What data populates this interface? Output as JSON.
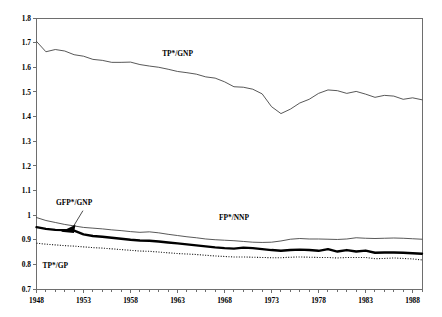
{
  "chart_data": {
    "type": "line",
    "title": "",
    "subtitle": "",
    "xlabel": "",
    "ylabel": "",
    "xlim": [
      1948,
      1989
    ],
    "ylim": [
      0.7,
      1.8
    ],
    "grid": false,
    "legend_position": "inline-annotations",
    "y_ticks": [
      "0.7",
      "0.8",
      "0.9",
      "1",
      "1.1",
      "1.2",
      "1.3",
      "1.4",
      "1.5",
      "1.6",
      "1.7",
      "1.8"
    ],
    "y_tick_values": [
      0.7,
      0.8,
      0.9,
      1.0,
      1.1,
      1.2,
      1.3,
      1.4,
      1.5,
      1.6,
      1.7,
      1.8
    ],
    "x_ticks": [
      "1948",
      "1953",
      "1958",
      "1963",
      "1968",
      "1973",
      "1978",
      "1983",
      "1988"
    ],
    "x_tick_values": [
      1948,
      1953,
      1958,
      1963,
      1968,
      1973,
      1978,
      1983,
      1988
    ],
    "x_minor_step": 1,
    "x": [
      1948,
      1949,
      1950,
      1951,
      1952,
      1953,
      1954,
      1955,
      1956,
      1957,
      1958,
      1959,
      1960,
      1961,
      1962,
      1963,
      1964,
      1965,
      1966,
      1967,
      1968,
      1969,
      1970,
      1971,
      1972,
      1973,
      1974,
      1975,
      1976,
      1977,
      1978,
      1979,
      1980,
      1981,
      1982,
      1983,
      1984,
      1985,
      1986,
      1987,
      1988,
      1989
    ],
    "series": [
      {
        "name": "TP*/GNP",
        "style": "thin-solid",
        "color": "#3a3a3a",
        "label_x": 1963,
        "label_y": 1.645,
        "values": [
          1.705,
          1.663,
          1.672,
          1.666,
          1.651,
          1.645,
          1.632,
          1.628,
          1.62,
          1.62,
          1.621,
          1.611,
          1.605,
          1.6,
          1.592,
          1.583,
          1.578,
          1.572,
          1.561,
          1.556,
          1.541,
          1.521,
          1.519,
          1.511,
          1.492,
          1.44,
          1.412,
          1.43,
          1.455,
          1.47,
          1.494,
          1.508,
          1.505,
          1.494,
          1.502,
          1.491,
          1.478,
          1.486,
          1.483,
          1.47,
          1.476,
          1.468
        ]
      },
      {
        "name": "FP*/NNP",
        "style": "thin-solid",
        "color": "#3a3a3a",
        "label_x": 1969,
        "label_y": 0.981,
        "values": [
          0.99,
          0.978,
          0.97,
          0.962,
          0.956,
          0.95,
          0.947,
          0.944,
          0.94,
          0.937,
          0.933,
          0.93,
          0.932,
          0.928,
          0.922,
          0.917,
          0.912,
          0.908,
          0.903,
          0.9,
          0.898,
          0.896,
          0.893,
          0.89,
          0.889,
          0.89,
          0.895,
          0.902,
          0.905,
          0.903,
          0.903,
          0.902,
          0.901,
          0.903,
          0.908,
          0.906,
          0.905,
          0.906,
          0.907,
          0.906,
          0.904,
          0.902
        ]
      },
      {
        "name": "GFP*/GNP",
        "style": "thick-solid",
        "color": "#000000",
        "label_x": 1952,
        "label_y": 1.041,
        "values": [
          0.951,
          0.944,
          0.94,
          0.939,
          0.937,
          0.922,
          0.915,
          0.912,
          0.908,
          0.904,
          0.9,
          0.897,
          0.896,
          0.893,
          0.889,
          0.885,
          0.881,
          0.877,
          0.873,
          0.869,
          0.866,
          0.864,
          0.868,
          0.866,
          0.862,
          0.858,
          0.855,
          0.858,
          0.86,
          0.858,
          0.855,
          0.862,
          0.852,
          0.858,
          0.852,
          0.856,
          0.847,
          0.848,
          0.848,
          0.847,
          0.845,
          0.843
        ]
      },
      {
        "name": "TP*/GP",
        "style": "dotted",
        "color": "#1a1a1a",
        "label_x": 1950,
        "label_y": 0.787,
        "values": [
          0.886,
          0.882,
          0.879,
          0.876,
          0.874,
          0.871,
          0.868,
          0.866,
          0.863,
          0.86,
          0.857,
          0.854,
          0.853,
          0.85,
          0.847,
          0.844,
          0.842,
          0.84,
          0.837,
          0.834,
          0.832,
          0.83,
          0.83,
          0.829,
          0.828,
          0.827,
          0.827,
          0.829,
          0.83,
          0.829,
          0.828,
          0.828,
          0.826,
          0.828,
          0.828,
          0.828,
          0.823,
          0.824,
          0.826,
          0.824,
          0.822,
          0.818
        ]
      }
    ],
    "annotations": [
      {
        "name": "gfp-gnp-arrow",
        "points_to_x": 1950.6,
        "points_to_y": 0.932,
        "from_x": 1952.3,
        "from_y": 1.018
      }
    ]
  }
}
